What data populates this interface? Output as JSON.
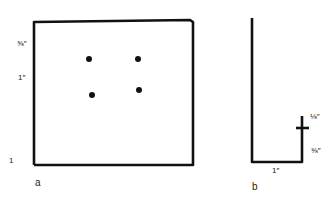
{
  "figure_a": {
    "caption": "a",
    "labels": {
      "top_offset": "⅝″",
      "spacing": "1″",
      "bottom": "1"
    },
    "frame": {
      "left": 34,
      "top_left_y": 22,
      "top_right_y": 20,
      "right": 193,
      "bottom": 165
    },
    "holes": [
      {
        "x": 89,
        "y": 59
      },
      {
        "x": 138,
        "y": 59
      },
      {
        "x": 92,
        "y": 95
      },
      {
        "x": 139,
        "y": 90
      }
    ]
  },
  "figure_b": {
    "caption": "b",
    "labels": {
      "flange_top": "⅛″",
      "flange_lower": "⅜″",
      "base_width": "1″"
    }
  },
  "colors": {
    "line": "#111111",
    "background": "#ffffff"
  }
}
